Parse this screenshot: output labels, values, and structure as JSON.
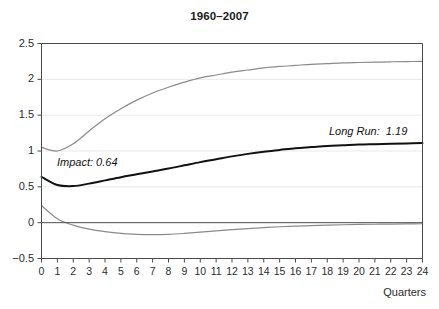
{
  "chart_data": {
    "type": "line",
    "title": "1960–2007",
    "xlabel": "Quarters",
    "ylabel": "",
    "xlim": [
      0,
      24
    ],
    "ylim": [
      -0.5,
      2.5
    ],
    "grid": true,
    "grid_axis": "y",
    "legend_position": "none",
    "x": [
      0,
      1,
      2,
      3,
      4,
      5,
      6,
      7,
      8,
      9,
      10,
      11,
      12,
      13,
      14,
      15,
      16,
      17,
      18,
      19,
      20,
      21,
      22,
      23,
      24
    ],
    "xticks": [
      "0",
      "1",
      "2",
      "3",
      "4",
      "5",
      "6",
      "7",
      "8",
      "9",
      "10",
      "11",
      "12",
      "13",
      "14",
      "15",
      "16",
      "17",
      "18",
      "19",
      "20",
      "21",
      "22",
      "23",
      "24"
    ],
    "yticks": [
      "2.5",
      "2",
      "1.5",
      "1",
      "0.5",
      "0",
      "−0.5"
    ],
    "ytick_values": [
      2.5,
      2,
      1.5,
      1,
      0.5,
      0,
      -0.5
    ],
    "series": [
      {
        "name": "upper-confidence-band",
        "color": "#8a8a8a",
        "width": 1.2,
        "values": [
          1.05,
          1.0,
          1.1,
          1.28,
          1.45,
          1.59,
          1.71,
          1.81,
          1.89,
          1.96,
          2.02,
          2.06,
          2.1,
          2.13,
          2.16,
          2.18,
          2.195,
          2.21,
          2.22,
          2.23,
          2.235,
          2.24,
          2.245,
          2.248,
          2.25
        ]
      },
      {
        "name": "point-estimate",
        "color": "#111111",
        "width": 2.0,
        "values": [
          0.64,
          0.525,
          0.51,
          0.545,
          0.59,
          0.635,
          0.675,
          0.715,
          0.755,
          0.8,
          0.845,
          0.885,
          0.925,
          0.96,
          0.99,
          1.015,
          1.04,
          1.055,
          1.07,
          1.08,
          1.09,
          1.095,
          1.1,
          1.105,
          1.11
        ]
      },
      {
        "name": "lower-confidence-band",
        "color": "#8a8a8a",
        "width": 1.2,
        "values": [
          0.24,
          0.055,
          -0.035,
          -0.09,
          -0.125,
          -0.15,
          -0.163,
          -0.168,
          -0.163,
          -0.15,
          -0.133,
          -0.115,
          -0.098,
          -0.082,
          -0.068,
          -0.057,
          -0.048,
          -0.04,
          -0.034,
          -0.029,
          -0.025,
          -0.022,
          -0.019,
          -0.017,
          -0.015
        ]
      },
      {
        "name": "zero-baseline",
        "color": "#555555",
        "width": 1.0,
        "values": [
          0,
          0,
          0,
          0,
          0,
          0,
          0,
          0,
          0,
          0,
          0,
          0,
          0,
          0,
          0,
          0,
          0,
          0,
          0,
          0,
          0,
          0,
          0,
          0,
          0
        ]
      }
    ],
    "annotations": [
      {
        "name": "impact",
        "text": "Impact: 0.64",
        "value": 0.64
      },
      {
        "name": "long-run",
        "text": "Long Run:  1.19",
        "value": 1.19
      }
    ]
  },
  "colors": {
    "axis": "#4a4a4a",
    "grid": "#e9e9e9",
    "band": "#8a8a8a",
    "estimate": "#111111",
    "text": "#2b2b2b",
    "background": "#ffffff"
  }
}
